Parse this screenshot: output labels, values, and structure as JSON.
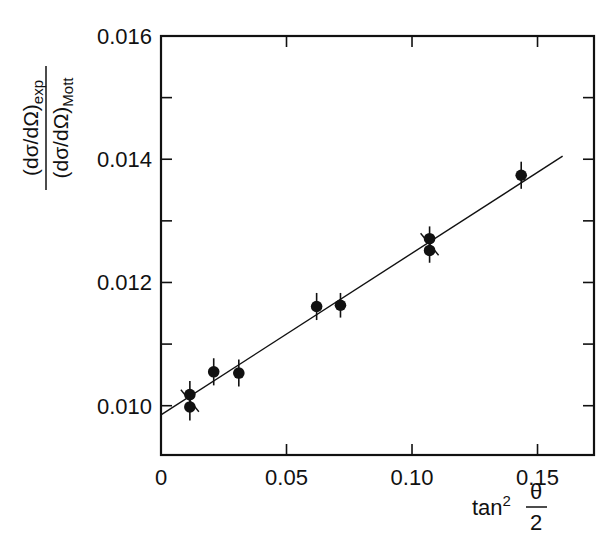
{
  "chart_data": {
    "type": "scatter",
    "title": "",
    "xlabel": "tan² θ/2",
    "xlabel_parts": {
      "base": "tan",
      "sup": "2",
      "frac_num": "θ",
      "frac_den": "2"
    },
    "ylabel": "(dσ/dΩ)exp / (dσ/dΩ)Mott",
    "ylabel_parts": {
      "num_main": "(dσ/dΩ)",
      "num_sub": "exp",
      "den_main": "(dσ/dΩ)",
      "den_sub": "Mott"
    },
    "xlim": [
      0,
      0.1725
    ],
    "ylim": [
      0.0092,
      0.016
    ],
    "x_ticks": [
      0,
      0.05,
      0.1,
      0.15
    ],
    "x_tick_labels": [
      "0",
      "0.05",
      "0.10",
      "0.15"
    ],
    "y_ticks": [
      0.01,
      0.011,
      0.012,
      0.013,
      0.014,
      0.015,
      0.016
    ],
    "y_tick_labels": [
      "0.010",
      "",
      "0.012",
      "",
      "0.014",
      "",
      "0.016"
    ],
    "grid": false,
    "legend": null,
    "series": [
      {
        "name": "measurements",
        "marker": "filled-circle",
        "color": "#111111",
        "points": [
          {
            "x": 0.0115,
            "y": 0.01018,
            "err": 0.00022
          },
          {
            "x": 0.0115,
            "y": 0.00998,
            "err": 0.00022
          },
          {
            "x": 0.021,
            "y": 0.01055,
            "err": 0.00022
          },
          {
            "x": 0.031,
            "y": 0.01053,
            "err": 0.00022
          },
          {
            "x": 0.062,
            "y": 0.01161,
            "err": 0.00022
          },
          {
            "x": 0.0715,
            "y": 0.01163,
            "err": 0.0002
          },
          {
            "x": 0.107,
            "y": 0.01271,
            "err": 0.0002
          },
          {
            "x": 0.107,
            "y": 0.01252,
            "err": 0.0002
          },
          {
            "x": 0.1435,
            "y": 0.01374,
            "err": 0.00022
          }
        ]
      },
      {
        "name": "linear fit",
        "type": "line",
        "color": "#111111",
        "x": [
          0,
          0.16
        ],
        "values": [
          0.00985,
          0.01405
        ]
      }
    ],
    "annotations": [
      {
        "type": "cross-marker",
        "x": 0.0115,
        "y": 0.01008
      },
      {
        "type": "cross-marker",
        "x": 0.107,
        "y": 0.01262
      }
    ]
  }
}
